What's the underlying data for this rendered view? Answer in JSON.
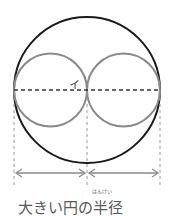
{
  "diagram": {
    "mark_label": "イ",
    "caption": "大きい円の半径",
    "caption_ruby": "はんけい",
    "colors": {
      "large_circle": "#1a1a1a",
      "small_circles": "#8a8a8a",
      "dashed_lines": "#9a9a9a",
      "arrows": "#8a8a8a"
    }
  }
}
